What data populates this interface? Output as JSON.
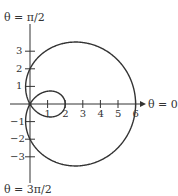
{
  "chart_data": {
    "type": "line",
    "title": "",
    "equation": "r = 2 + 4cos(θ)",
    "x_ticks": [
      "1",
      "2",
      "3",
      "4",
      "5",
      "6"
    ],
    "y_ticks": [
      "3",
      "2",
      "1",
      "-1",
      "-2",
      "-3"
    ],
    "xlim": [
      0,
      6
    ],
    "ylim": [
      -3.5,
      3.5
    ],
    "grid": false,
    "axis_labels": {
      "top": "θ = π/2",
      "right": "θ = 0",
      "bottom": "θ = 3π/2"
    },
    "key_points": [
      {
        "theta": "0",
        "r": 6
      },
      {
        "theta": "π/2",
        "r": 2
      },
      {
        "theta": "π",
        "r": -2
      },
      {
        "theta": "3π/2",
        "r": 2
      }
    ]
  },
  "labels": {
    "top": "θ = π/2",
    "right": "θ = 0",
    "bottom": "θ = 3π/2",
    "x": [
      "1",
      "2",
      "3",
      "4",
      "5",
      "6"
    ],
    "y_pos": [
      "3",
      "2",
      "1"
    ],
    "y_neg": [
      "−1",
      "−2",
      "−3"
    ]
  }
}
